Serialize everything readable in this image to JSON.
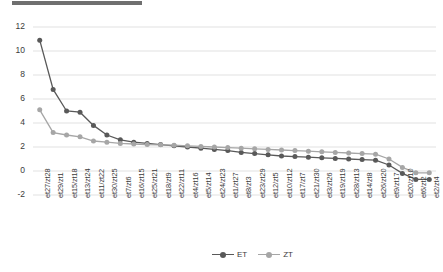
{
  "chart_data": {
    "type": "line",
    "title": "",
    "xlabel": "",
    "ylabel": "",
    "ylim": [
      -2,
      12
    ],
    "yticks": [
      -2,
      0,
      2,
      4,
      6,
      8,
      10,
      12
    ],
    "grid": true,
    "legend_position": "bottom-center",
    "categories": [
      "et27/zt28",
      "et29/zt1",
      "et15/zt18",
      "et13/zt24",
      "et11/zt22",
      "et30/zt25",
      "et7/zt6",
      "et16/zt15",
      "et25/zt21",
      "et18/zt9",
      "et22/zt11",
      "et4/zt16",
      "et5/zt14",
      "et24/zt23",
      "et1/zt27",
      "et8/zt3",
      "et23/zt29",
      "et12/zt5",
      "et10/zt12",
      "et17/zt7",
      "et21/zt30",
      "et3/zt26",
      "et19/zt19",
      "et28/zt13",
      "et14/zt8",
      "et26/zt20",
      "et9/zt17",
      "et20/zt10",
      "et6/zt2",
      "et2/zt4"
    ],
    "series": [
      {
        "name": "ET",
        "color": "#595959",
        "values": [
          10.9,
          6.8,
          5.0,
          4.9,
          3.8,
          3.0,
          2.6,
          2.4,
          2.3,
          2.2,
          2.1,
          2.0,
          1.9,
          1.8,
          1.7,
          1.55,
          1.45,
          1.35,
          1.25,
          1.2,
          1.15,
          1.1,
          1.05,
          1.0,
          0.95,
          0.9,
          0.5,
          -0.2,
          -0.7,
          -0.7
        ]
      },
      {
        "name": "ZT",
        "color": "#a6a6a6",
        "values": [
          5.1,
          3.2,
          3.0,
          2.85,
          2.5,
          2.4,
          2.3,
          2.25,
          2.2,
          2.18,
          2.15,
          2.1,
          2.05,
          2.0,
          1.95,
          1.9,
          1.85,
          1.8,
          1.75,
          1.7,
          1.65,
          1.6,
          1.55,
          1.5,
          1.45,
          1.4,
          1.0,
          0.3,
          -0.15,
          -0.15
        ]
      }
    ]
  },
  "legend": {
    "items": [
      {
        "label": "ET",
        "color": "#595959"
      },
      {
        "label": "ZT",
        "color": "#a6a6a6"
      }
    ]
  },
  "axis": {
    "y_tick_labels": [
      "12",
      "10",
      "8",
      "6",
      "4",
      "2",
      "0",
      "-2"
    ]
  }
}
